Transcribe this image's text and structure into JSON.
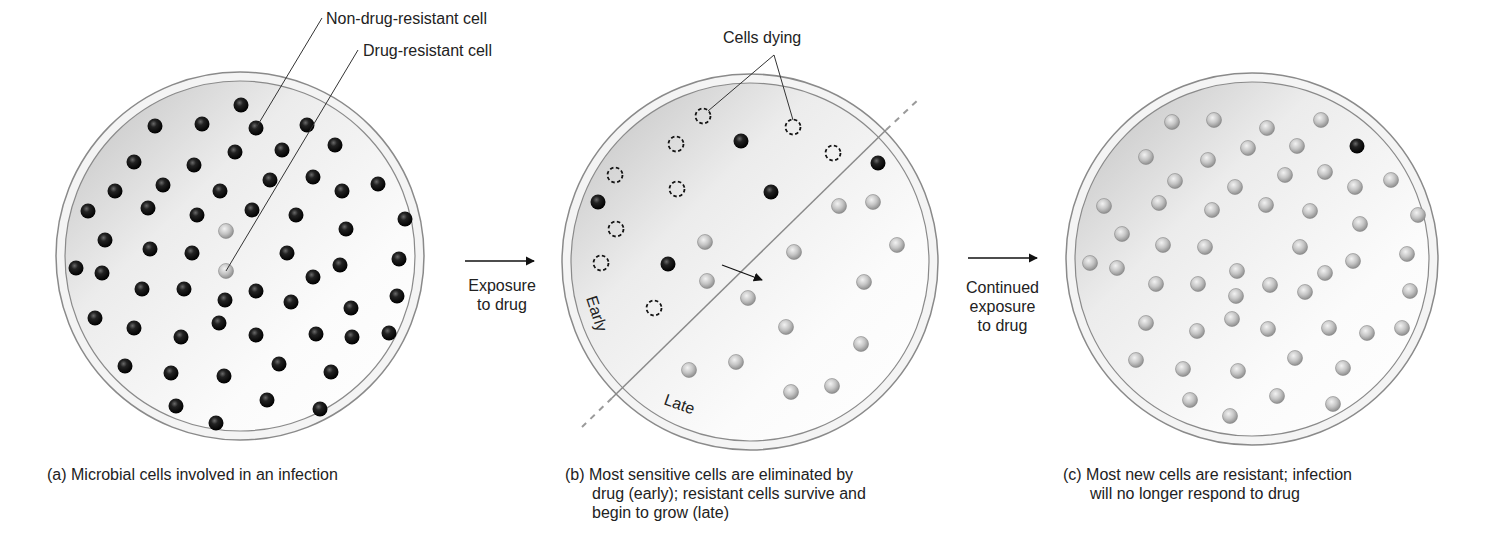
{
  "labels": {
    "non_resistant": "Non-drug-resistant cell",
    "resistant": "Drug-resistant cell",
    "cells_dying": "Cells dying",
    "early": "Early",
    "late": "Late"
  },
  "transitions": {
    "first": [
      "Exposure",
      "to drug"
    ],
    "second": [
      "Continued",
      "exposure",
      "to drug"
    ]
  },
  "captions": {
    "a": [
      "(a) Microbial cells involved in an infection"
    ],
    "b": [
      "(b) Most sensitive cells are eliminated by",
      "drug (early); resistant cells survive and",
      "begin to grow (late)"
    ],
    "c": [
      "(c) Most new cells are resistant; infection",
      "will no longer respond to drug"
    ]
  },
  "colors": {
    "dish_rim": "#8a8a8a",
    "dish_fill_dark": "#c8c8c8",
    "dish_fill_light": "#fafafa",
    "sensitive_cell": "#1a1a1a",
    "resistant_cell": "#b5b5b5",
    "line": "#333333"
  },
  "panels": {
    "a": {
      "cx": 240,
      "cy": 256,
      "r": 184,
      "dark": [
        [
          241,
          105
        ],
        [
          155,
          126
        ],
        [
          202,
          124
        ],
        [
          256,
          128
        ],
        [
          307,
          125
        ],
        [
          134,
          162
        ],
        [
          194,
          165
        ],
        [
          235,
          152
        ],
        [
          282,
          150
        ],
        [
          335,
          145
        ],
        [
          115,
          191
        ],
        [
          163,
          185
        ],
        [
          220,
          191
        ],
        [
          270,
          180
        ],
        [
          313,
          177
        ],
        [
          342,
          191
        ],
        [
          378,
          184
        ],
        [
          88,
          211
        ],
        [
          148,
          208
        ],
        [
          197,
          215
        ],
        [
          252,
          210
        ],
        [
          296,
          215
        ],
        [
          405,
          219
        ],
        [
          105,
          240
        ],
        [
          150,
          249
        ],
        [
          192,
          253
        ],
        [
          287,
          253
        ],
        [
          346,
          229
        ],
        [
          399,
          259
        ],
        [
          76,
          268
        ],
        [
          102,
          273
        ],
        [
          142,
          289
        ],
        [
          184,
          289
        ],
        [
          225,
          300
        ],
        [
          256,
          291
        ],
        [
          291,
          302
        ],
        [
          340,
          265
        ],
        [
          313,
          277
        ],
        [
          351,
          308
        ],
        [
          397,
          296
        ],
        [
          95,
          318
        ],
        [
          134,
          328
        ],
        [
          181,
          337
        ],
        [
          219,
          323
        ],
        [
          256,
          335
        ],
        [
          316,
          334
        ],
        [
          352,
          337
        ],
        [
          389,
          333
        ],
        [
          125,
          366
        ],
        [
          171,
          373
        ],
        [
          224,
          376
        ],
        [
          279,
          364
        ],
        [
          331,
          372
        ],
        [
          176,
          406
        ],
        [
          267,
          400
        ],
        [
          320,
          409
        ],
        [
          216,
          423
        ]
      ],
      "light": [
        [
          226,
          231
        ],
        [
          226,
          271
        ]
      ]
    },
    "b": {
      "cx": 750,
      "cy": 262,
      "r": 188,
      "dying": [
        [
          703,
          116
        ],
        [
          793,
          127
        ],
        [
          676,
          144
        ],
        [
          833,
          153
        ],
        [
          615,
          175
        ],
        [
          677,
          189
        ],
        [
          616,
          229
        ],
        [
          601,
          263
        ],
        [
          654,
          308
        ]
      ],
      "dark": [
        [
          741,
          141
        ],
        [
          878,
          163
        ],
        [
          598,
          202
        ],
        [
          771,
          192
        ],
        [
          668,
          264
        ]
      ],
      "light": [
        [
          839,
          206
        ],
        [
          873,
          202
        ],
        [
          705,
          242
        ],
        [
          794,
          252
        ],
        [
          897,
          245
        ],
        [
          707,
          281
        ],
        [
          748,
          298
        ],
        [
          864,
          282
        ],
        [
          786,
          327
        ],
        [
          861,
          344
        ],
        [
          689,
          370
        ],
        [
          736,
          362
        ],
        [
          791,
          392
        ],
        [
          832,
          386
        ]
      ]
    },
    "c": {
      "cx": 1252,
      "cy": 259,
      "r": 186,
      "dark": [
        [
          1357,
          146
        ]
      ],
      "light": [
        [
          1172,
          122
        ],
        [
          1214,
          120
        ],
        [
          1267,
          128
        ],
        [
          1321,
          120
        ],
        [
          1146,
          157
        ],
        [
          1208,
          160
        ],
        [
          1248,
          148
        ],
        [
          1297,
          146
        ],
        [
          1175,
          181
        ],
        [
          1235,
          187
        ],
        [
          1285,
          175
        ],
        [
          1325,
          172
        ],
        [
          1355,
          187
        ],
        [
          1391,
          180
        ],
        [
          1104,
          206
        ],
        [
          1159,
          203
        ],
        [
          1212,
          210
        ],
        [
          1266,
          205
        ],
        [
          1310,
          211
        ],
        [
          1418,
          215
        ],
        [
          1122,
          234
        ],
        [
          1163,
          245
        ],
        [
          1205,
          247
        ],
        [
          1300,
          247
        ],
        [
          1360,
          224
        ],
        [
          1407,
          254
        ],
        [
          1090,
          263
        ],
        [
          1117,
          268
        ],
        [
          1156,
          284
        ],
        [
          1198,
          284
        ],
        [
          1237,
          271
        ],
        [
          1270,
          285
        ],
        [
          1325,
          273
        ],
        [
          1353,
          261
        ],
        [
          1236,
          296
        ],
        [
          1305,
          292
        ],
        [
          1410,
          291
        ],
        [
          1146,
          323
        ],
        [
          1197,
          331
        ],
        [
          1232,
          319
        ],
        [
          1268,
          329
        ],
        [
          1329,
          328
        ],
        [
          1367,
          333
        ],
        [
          1402,
          328
        ],
        [
          1136,
          360
        ],
        [
          1183,
          369
        ],
        [
          1238,
          371
        ],
        [
          1295,
          358
        ],
        [
          1343,
          368
        ],
        [
          1190,
          400
        ],
        [
          1277,
          396
        ],
        [
          1333,
          404
        ],
        [
          1230,
          416
        ]
      ]
    }
  }
}
